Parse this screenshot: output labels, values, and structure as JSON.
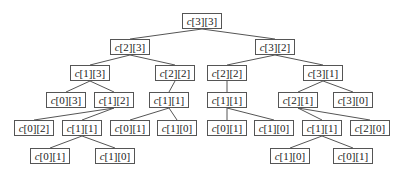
{
  "diagram": {
    "type": "recursion-tree",
    "colors": {
      "line": "#555555",
      "box_border": "#555555",
      "text": "#222222",
      "background": "#ffffff"
    },
    "nodes": [
      {
        "id": "n0",
        "var": "c",
        "idx": "[3][3]",
        "x": 182,
        "y": 13,
        "w": 40,
        "parent": null
      },
      {
        "id": "n1",
        "var": "c",
        "idx": "[2][3]",
        "x": 110,
        "y": 39,
        "w": 40,
        "parent": "n0"
      },
      {
        "id": "n2",
        "var": "c",
        "idx": "[3][2]",
        "x": 255,
        "y": 39,
        "w": 40,
        "parent": "n0"
      },
      {
        "id": "n3",
        "var": "c",
        "idx": "[1][3]",
        "x": 70,
        "y": 65,
        "w": 40,
        "parent": "n1"
      },
      {
        "id": "n4",
        "var": "c",
        "idx": "[2][2]",
        "x": 155,
        "y": 65,
        "w": 40,
        "parent": "n1"
      },
      {
        "id": "n5",
        "var": "c",
        "idx": "[2][2]",
        "x": 207,
        "y": 65,
        "w": 40,
        "parent": "n2"
      },
      {
        "id": "n6",
        "var": "c",
        "idx": "[3][1]",
        "x": 303,
        "y": 65,
        "w": 40,
        "parent": "n2"
      },
      {
        "id": "n7",
        "var": "c",
        "idx": "[0][3]",
        "x": 46,
        "y": 92,
        "w": 40,
        "parent": "n3"
      },
      {
        "id": "n8",
        "var": "c",
        "idx": "[1][2]",
        "x": 94,
        "y": 92,
        "w": 40,
        "parent": "n3"
      },
      {
        "id": "n9",
        "var": "c",
        "idx": "[1][1]",
        "x": 149,
        "y": 92,
        "w": 40,
        "parent": "n4"
      },
      {
        "id": "n10",
        "var": "c",
        "idx": "[1][1]",
        "x": 207,
        "y": 92,
        "w": 40,
        "parent": "n5"
      },
      {
        "id": "n11",
        "var": "c",
        "idx": "[2][1]",
        "x": 278,
        "y": 92,
        "w": 40,
        "parent": "n6"
      },
      {
        "id": "n12",
        "var": "c",
        "idx": "[3][0]",
        "x": 333,
        "y": 92,
        "w": 40,
        "parent": "n6"
      },
      {
        "id": "n13",
        "var": "c",
        "idx": "[0][2]",
        "x": 14,
        "y": 120,
        "w": 40,
        "parent": "n8"
      },
      {
        "id": "n14",
        "var": "c",
        "idx": "[1][1]",
        "x": 62,
        "y": 120,
        "w": 40,
        "parent": "n8"
      },
      {
        "id": "n15",
        "var": "c",
        "idx": "[0][1]",
        "x": 110,
        "y": 120,
        "w": 40,
        "parent": "n9"
      },
      {
        "id": "n16",
        "var": "c",
        "idx": "[1][0]",
        "x": 157,
        "y": 120,
        "w": 40,
        "parent": "n9"
      },
      {
        "id": "n17",
        "var": "c",
        "idx": "[0][1]",
        "x": 207,
        "y": 120,
        "w": 40,
        "parent": "n10"
      },
      {
        "id": "n18",
        "var": "c",
        "idx": "[1][0]",
        "x": 254,
        "y": 120,
        "w": 40,
        "parent": "n10"
      },
      {
        "id": "n19",
        "var": "c",
        "idx": "[1][1]",
        "x": 302,
        "y": 120,
        "w": 40,
        "parent": "n11"
      },
      {
        "id": "n20",
        "var": "c",
        "idx": "[2][0]",
        "x": 350,
        "y": 120,
        "w": 40,
        "parent": "n11"
      },
      {
        "id": "n21",
        "var": "c",
        "idx": "[0][1]",
        "x": 30,
        "y": 148,
        "w": 40,
        "parent": "n14"
      },
      {
        "id": "n22",
        "var": "c",
        "idx": "[1][0]",
        "x": 95,
        "y": 148,
        "w": 40,
        "parent": "n14"
      },
      {
        "id": "n23",
        "var": "c",
        "idx": "[1][0]",
        "x": 270,
        "y": 148,
        "w": 40,
        "parent": "n19"
      },
      {
        "id": "n24",
        "var": "c",
        "idx": "[0][1]",
        "x": 333,
        "y": 148,
        "w": 40,
        "parent": "n19"
      }
    ]
  }
}
